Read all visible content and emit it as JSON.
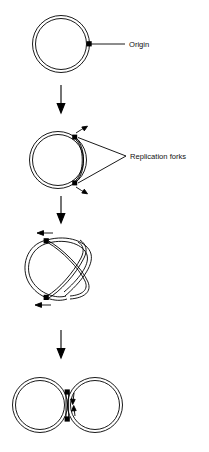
{
  "figure": {
    "background_color": "#ffffff",
    "ink_color": "#000000",
    "width": 209,
    "height": 452
  },
  "labels": {
    "origin": "Origin",
    "replication_forks": "Replication forks"
  },
  "stages": [
    {
      "id": "stage-1",
      "name": "circular-chromosome-with-origin",
      "caption": "Origin",
      "marker_count": 1
    },
    {
      "id": "stage-2",
      "name": "replication-bubble-two-forks",
      "caption": "Replication forks",
      "marker_count": 2
    },
    {
      "id": "stage-3",
      "name": "theta-intermediate",
      "caption": "",
      "marker_count": 2
    },
    {
      "id": "stage-4",
      "name": "two-daughter-circles",
      "caption": "",
      "marker_count": 2
    }
  ],
  "transition_arrows": [
    {
      "id": "arrow-1",
      "direction": "down"
    },
    {
      "id": "arrow-2",
      "direction": "down"
    },
    {
      "id": "arrow-3",
      "direction": "down"
    }
  ],
  "fork_direction_arrows": [
    {
      "id": "stage2-fork-arrow-upper",
      "direction": "up-right"
    },
    {
      "id": "stage2-fork-arrow-lower",
      "direction": "down-right"
    },
    {
      "id": "stage3-fork-arrow-upper",
      "direction": "left"
    },
    {
      "id": "stage3-fork-arrow-lower",
      "direction": "left"
    },
    {
      "id": "stage4-fork-arrow-upper",
      "direction": "down"
    },
    {
      "id": "stage4-fork-arrow-lower",
      "direction": "up"
    }
  ]
}
